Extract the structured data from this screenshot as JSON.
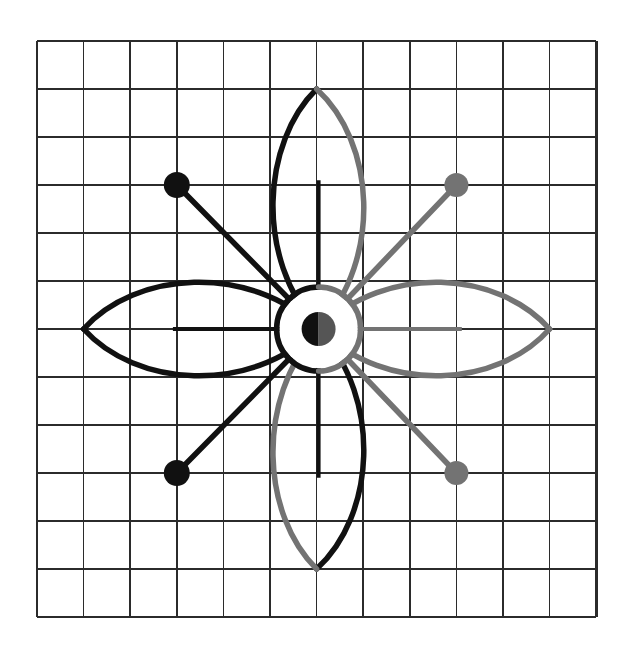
{
  "canvas": {
    "width": 631,
    "height": 652,
    "background": "#ffffff"
  },
  "colors": {
    "grid_line": "#2b2b2b",
    "dark_stroke": "#111111",
    "light_stroke": "#737373",
    "paper": "#ffffff",
    "center_fill": "#ffffff"
  },
  "grid": {
    "label": "square grid",
    "columns": 12,
    "rows": 12,
    "origin_x": 37,
    "origin_y": 41,
    "cell_width": 46.6,
    "cell_height": 48.0,
    "line_width": 1.6,
    "border_width": 2.6,
    "total_width": 559,
    "total_height": 576
  },
  "figure": {
    "name": "four-petal rosette with four radial spokes",
    "center_cell_x": 6,
    "center_cell_y": 6,
    "center_x": 318.6,
    "center_y": 329.0,
    "stroke_width": 5.5,
    "hub": {
      "outer_radius": 42,
      "outer_stroke_dark": "#111111",
      "outer_stroke_light": "#737373",
      "inner_radius": 17,
      "inner_fill_left": "#111111",
      "inner_fill_right": "#555555"
    },
    "petals": [
      {
        "name": "petal-up",
        "direction": "up",
        "tip_cell_x": 6,
        "tip_cell_y": 1,
        "length_cells": 5,
        "half_width_cells": 1.5,
        "left_half_color": "#111111",
        "right_half_color": "#737373",
        "midrib": true
      },
      {
        "name": "petal-right",
        "direction": "right",
        "tip_cell_x": 11,
        "tip_cell_y": 6,
        "length_cells": 5,
        "half_width_cells": 1.5,
        "left_half_color": "#737373",
        "right_half_color": "#737373",
        "midrib": true
      },
      {
        "name": "petal-down",
        "direction": "down",
        "tip_cell_x": 6,
        "tip_cell_y": 11,
        "length_cells": 5,
        "half_width_cells": 1.5,
        "left_half_color": "#111111",
        "right_half_color": "#737373",
        "midrib": true
      },
      {
        "name": "petal-left",
        "direction": "left",
        "tip_cell_x": 1,
        "tip_cell_y": 6,
        "length_cells": 5,
        "half_width_cells": 1.5,
        "left_half_color": "#111111",
        "right_half_color": "#111111",
        "midrib": true
      }
    ],
    "spokes": [
      {
        "name": "spoke-up-left",
        "end_cell_x": 3,
        "end_cell_y": 3,
        "color": "#111111",
        "dot_radius": 13,
        "dot_color": "#111111"
      },
      {
        "name": "spoke-up-right",
        "end_cell_x": 9,
        "end_cell_y": 3,
        "color": "#737373",
        "dot_radius": 12,
        "dot_color": "#737373"
      },
      {
        "name": "spoke-down-left",
        "end_cell_x": 3,
        "end_cell_y": 9,
        "color": "#111111",
        "dot_radius": 13,
        "dot_color": "#111111"
      },
      {
        "name": "spoke-down-right",
        "end_cell_x": 9,
        "end_cell_y": 9,
        "color": "#737373",
        "dot_radius": 12,
        "dot_color": "#737373"
      }
    ]
  }
}
